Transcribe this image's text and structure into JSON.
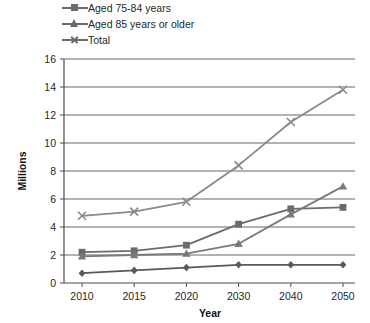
{
  "chart_data": {
    "type": "line",
    "title": "",
    "xlabel": "Year",
    "ylabel": "Millions",
    "categories": [
      "2010",
      "2015",
      "2020",
      "2030",
      "2040",
      "2050"
    ],
    "x": [
      2010,
      2015,
      2020,
      2030,
      2040,
      2050
    ],
    "ylim": [
      0,
      16
    ],
    "ytick_step": 2,
    "yticks": [
      "0",
      "2",
      "4",
      "6",
      "8",
      "10",
      "12",
      "14",
      "16"
    ],
    "grid": "horizontal",
    "legend_position": "top-left",
    "note": "Topmost legend entry is cropped off the top edge of the screenshot; its diamond-marker series is plotted lowest.",
    "series": [
      {
        "name": "",
        "marker": "diamond",
        "legend_visible": false,
        "color": "#5a5a5a",
        "values": [
          0.7,
          0.9,
          1.1,
          1.3,
          1.3,
          1.3
        ]
      },
      {
        "name": "Aged 75-84 years",
        "marker": "square",
        "legend_visible": true,
        "color": "#6b6b6b",
        "values": [
          2.2,
          2.3,
          2.7,
          4.2,
          5.3,
          5.4
        ]
      },
      {
        "name": "Aged 85 years or older",
        "marker": "triangle",
        "legend_visible": true,
        "color": "#7a7a7a",
        "values": [
          1.9,
          2.0,
          2.1,
          2.8,
          4.9,
          6.9
        ]
      },
      {
        "name": "Total",
        "marker": "x",
        "legend_visible": true,
        "color": "#8a8a8a",
        "values": [
          4.8,
          5.1,
          5.8,
          8.4,
          11.5,
          13.8
        ]
      }
    ]
  },
  "legend": {
    "items": [
      {
        "label": "Aged 75-84 years",
        "marker": "square"
      },
      {
        "label": "Aged 85 years or older",
        "marker": "triangle"
      },
      {
        "label": "Total",
        "marker": "x"
      }
    ]
  },
  "axes": {
    "y_title": "Millions",
    "x_title": "Year"
  }
}
